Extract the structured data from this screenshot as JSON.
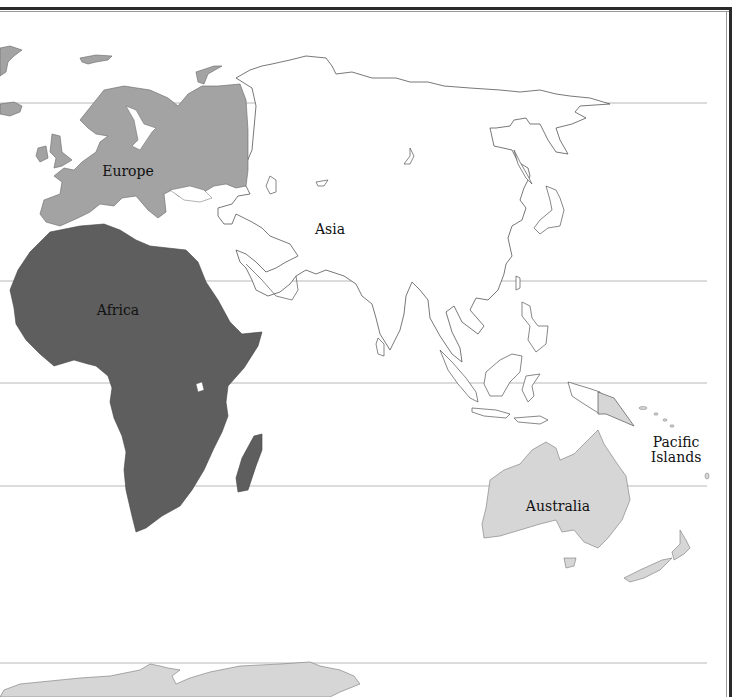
{
  "map": {
    "title": "",
    "labels": {
      "europe": "Europe",
      "asia": "Asia",
      "africa": "Africa",
      "australia": "Australia",
      "pacific_line1": "Pacific",
      "pacific_line2": "Islands"
    },
    "colors": {
      "europe": "#a3a3a3",
      "africa": "#5e5e5e",
      "australia": "#d6d6d6",
      "antarctica": "#d6d6d6",
      "asia": "#ffffff",
      "outline": "#555555",
      "latitude_lines": "#b0b0b0",
      "frame": "#2a2a2a"
    },
    "latitude_lines_y": [
      103,
      281,
      383,
      486,
      663
    ]
  }
}
